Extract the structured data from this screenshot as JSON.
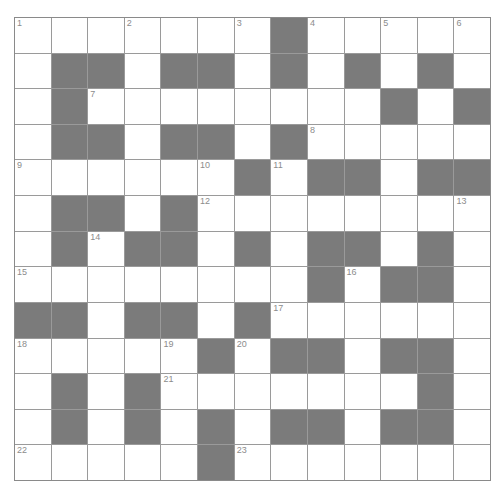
{
  "puzzle": {
    "rows": 13,
    "cols": 13,
    "colors": {
      "block": "#7b7b7b",
      "cell": "#ffffff",
      "grid_line": "#9a9a9a",
      "number": "#8c8c8c"
    },
    "layout": [
      "0000000100000",
      "0110110101010",
      "0100000000101",
      "0110110100000",
      "0000001011011",
      "0110100000000",
      "0101101011010",
      "0000000010110",
      "1101101000000",
      "0000010110110",
      "0101000000010",
      "0101010110110",
      "0000010000000"
    ],
    "numbers": [
      {
        "r": 0,
        "c": 0,
        "n": "1"
      },
      {
        "r": 0,
        "c": 3,
        "n": "2"
      },
      {
        "r": 0,
        "c": 6,
        "n": "3"
      },
      {
        "r": 0,
        "c": 8,
        "n": "4"
      },
      {
        "r": 0,
        "c": 10,
        "n": "5"
      },
      {
        "r": 0,
        "c": 12,
        "n": "6"
      },
      {
        "r": 2,
        "c": 2,
        "n": "7"
      },
      {
        "r": 3,
        "c": 8,
        "n": "8"
      },
      {
        "r": 4,
        "c": 0,
        "n": "9"
      },
      {
        "r": 4,
        "c": 5,
        "n": "10"
      },
      {
        "r": 4,
        "c": 7,
        "n": "11"
      },
      {
        "r": 5,
        "c": 5,
        "n": "12"
      },
      {
        "r": 5,
        "c": 12,
        "n": "13"
      },
      {
        "r": 6,
        "c": 2,
        "n": "14"
      },
      {
        "r": 7,
        "c": 0,
        "n": "15"
      },
      {
        "r": 7,
        "c": 9,
        "n": "16"
      },
      {
        "r": 8,
        "c": 7,
        "n": "17"
      },
      {
        "r": 9,
        "c": 0,
        "n": "18"
      },
      {
        "r": 9,
        "c": 4,
        "n": "19"
      },
      {
        "r": 9,
        "c": 6,
        "n": "20"
      },
      {
        "r": 10,
        "c": 4,
        "n": "21"
      },
      {
        "r": 12,
        "c": 0,
        "n": "22"
      },
      {
        "r": 12,
        "c": 6,
        "n": "23"
      }
    ]
  }
}
